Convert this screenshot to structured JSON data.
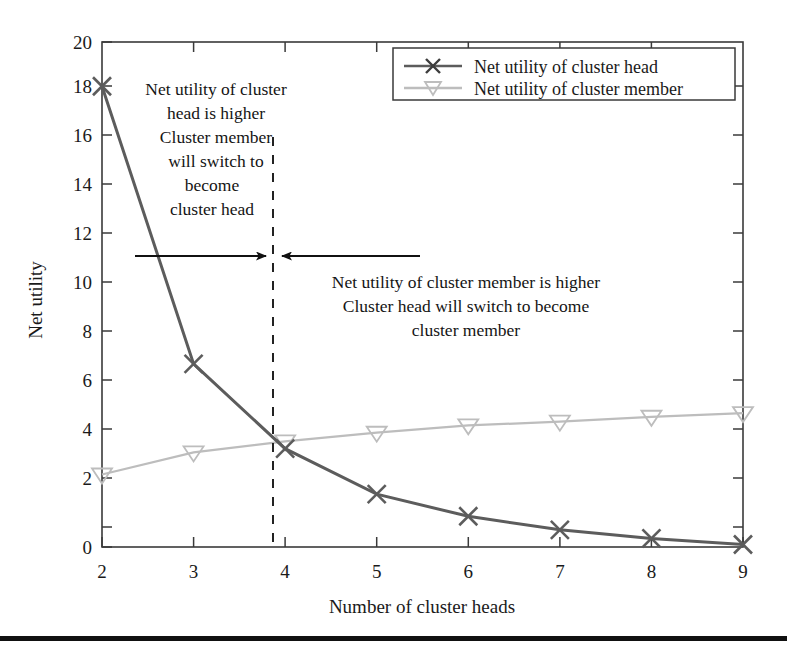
{
  "figure": {
    "background_color": "#ffffff",
    "bottom_rule_color": "#111111"
  },
  "axes": {
    "xlabel": "Number of cluster heads",
    "ylabel": "Net utility",
    "x_ticks": [
      "2",
      "3",
      "4",
      "5",
      "6",
      "7",
      "8",
      "9"
    ],
    "y_ticks": [
      "0",
      "2",
      "4",
      "6",
      "8",
      "10",
      "12",
      "14",
      "16",
      "18",
      "20"
    ],
    "frame_color": "#3a3a3a"
  },
  "legend": {
    "items": [
      {
        "label": "Net utility of cluster head",
        "marker": "x-marker",
        "color": "#5c5c5c"
      },
      {
        "label": "Net utility of cluster member",
        "marker": "triangle-down-marker",
        "color": "#bdbdbd"
      }
    ]
  },
  "annotations": {
    "left": {
      "lines": [
        "Net utility of cluster",
        "head is higher",
        "Cluster member",
        "will switch to",
        "become",
        "cluster head"
      ]
    },
    "right": {
      "lines": [
        "Net utility of cluster member is higher",
        "Cluster head will switch to become",
        "cluster member"
      ]
    },
    "divider": {
      "x_value": 3.85,
      "style": "dashed",
      "color": "#222222"
    },
    "arrow_left": {
      "direction": "right",
      "color": "#111111"
    },
    "arrow_right": {
      "direction": "left",
      "color": "#111111"
    }
  },
  "chart_data": {
    "type": "line",
    "title": "",
    "xlabel": "Number of cluster heads",
    "ylabel": "Net utility",
    "x": [
      2,
      3,
      4,
      5,
      6,
      7,
      8,
      9
    ],
    "xlim": [
      2,
      9
    ],
    "ylim": [
      -0.55,
      20
    ],
    "yticks": [
      0,
      2,
      4,
      6,
      8,
      10,
      12,
      14,
      16,
      18,
      20
    ],
    "grid": false,
    "legend_position": "top-right",
    "series": [
      {
        "name": "Net utility of cluster head",
        "color": "#5c5c5c",
        "marker": "x",
        "values": [
          18.2,
          6.9,
          3.45,
          1.6,
          0.7,
          0.15,
          -0.2,
          -0.45
        ]
      },
      {
        "name": "Net utility of cluster member",
        "color": "#bdbdbd",
        "marker": "v",
        "values": [
          2.4,
          3.3,
          3.75,
          4.1,
          4.4,
          4.55,
          4.75,
          4.9
        ]
      }
    ],
    "annotations": [
      {
        "text": "Net utility of cluster head is higher Cluster member will switch to become cluster head",
        "region": "left-of-divider"
      },
      {
        "text": "Net utility of cluster member is higher Cluster head will switch to become cluster member",
        "region": "right-of-divider"
      },
      {
        "text": "crossover",
        "type": "vline",
        "x": 3.85
      }
    ]
  }
}
